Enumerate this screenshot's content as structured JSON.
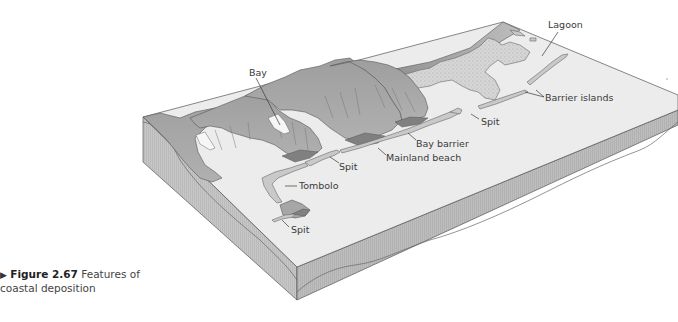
{
  "diagram": {
    "title": "Features of coastal deposition",
    "type": "block-diagram",
    "labels": [
      {
        "id": "lagoon",
        "text": "Lagoon"
      },
      {
        "id": "bay",
        "text": "Bay"
      },
      {
        "id": "barrier-islands",
        "text": "Barrier islands"
      },
      {
        "id": "spit-right",
        "text": "Spit"
      },
      {
        "id": "bay-barrier",
        "text": "Bay barrier"
      },
      {
        "id": "mainland-beach",
        "text": "Mainland beach"
      },
      {
        "id": "spit-middle",
        "text": "Spit"
      },
      {
        "id": "tombolo",
        "text": "Tombolo"
      },
      {
        "id": "spit-lower",
        "text": "Spit"
      }
    ],
    "colors": {
      "sea_surface": "#ececec",
      "block_side_front": "#bcbcbc",
      "block_side_left": "#c4c4c4",
      "headland": "#a4a4a4",
      "headland_dark": "#8a8a8a",
      "deposit": "#c8c8c8",
      "lagoon_fill": "#d8d8d8",
      "outline": "#555555"
    }
  },
  "caption": {
    "marker": "▶",
    "figure_number": "Figure 2.67",
    "text": "Features of coastal deposition"
  }
}
